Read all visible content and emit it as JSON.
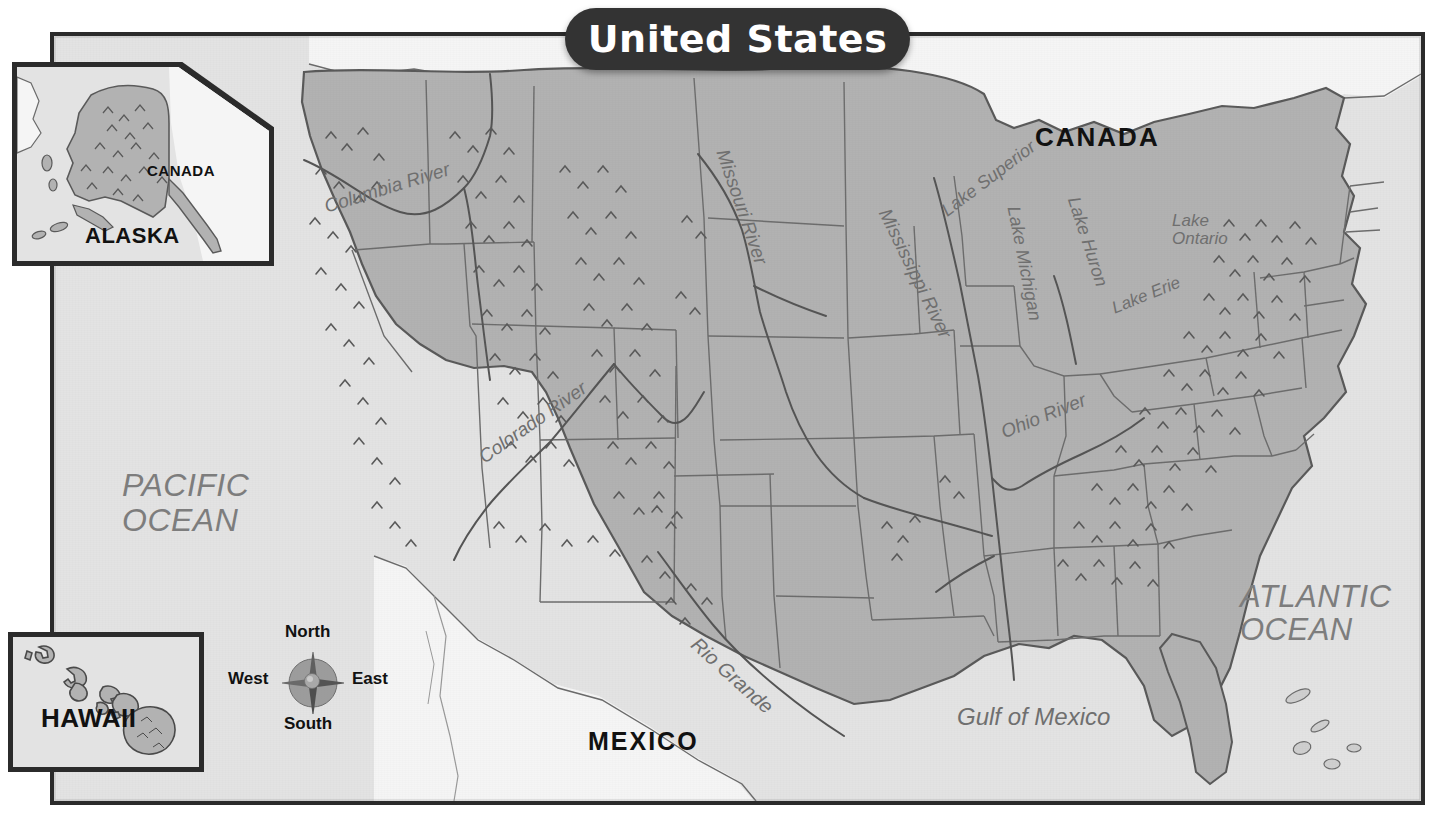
{
  "title": "United States",
  "colors": {
    "title_pill": "#333333",
    "title_text": "#ffffff",
    "us_land": "#b2b2b2",
    "neighbor_land": "#f5f5f5",
    "ocean": "#e3e3e3",
    "frame": "#2b2b2b",
    "label_water": "#6f6f6f",
    "label_country": "#111111"
  },
  "countries": [
    {
      "name": "CANADA",
      "x": 1035,
      "y": 122,
      "size": 26
    },
    {
      "name": "MEXICO",
      "x": 588,
      "y": 727,
      "size": 25
    }
  ],
  "oceans": [
    {
      "lines": [
        "PACIFIC",
        "OCEAN"
      ],
      "x": 122,
      "y": 468,
      "size": 32
    },
    {
      "lines": [
        "ATLANTIC",
        "OCEAN"
      ],
      "x": 1240,
      "y": 580,
      "size": 31
    }
  ],
  "water_labels": [
    {
      "name": "Gulf of Mexico",
      "x": 957,
      "y": 703,
      "size": 24,
      "rotate": 0
    },
    {
      "name": "Columbia River",
      "x": 325,
      "y": 196,
      "size": 19,
      "rotate": -17
    },
    {
      "name": "Colorado River",
      "x": 481,
      "y": 448,
      "size": 19,
      "rotate": -35
    },
    {
      "name": "Missouri River",
      "x": 722,
      "y": 139,
      "size": 19,
      "rotate": 71
    },
    {
      "name": "Mississippi River",
      "x": 884,
      "y": 199,
      "size": 19,
      "rotate": 64
    },
    {
      "name": "Ohio River",
      "x": 1002,
      "y": 422,
      "size": 19,
      "rotate": -22
    },
    {
      "name": "Rio Grande",
      "x": 694,
      "y": 630,
      "size": 20,
      "rotate": 42
    },
    {
      "name": "Lake Superior",
      "x": 944,
      "y": 202,
      "size": 18,
      "rotate": -37
    },
    {
      "name": "Lake Michigan",
      "x": 1013,
      "y": 196,
      "size": 18,
      "rotate": 79
    },
    {
      "name": "Lake Huron",
      "x": 1073,
      "y": 187,
      "size": 18,
      "rotate": 72
    },
    {
      "name": "Lake Erie",
      "x": 1113,
      "y": 299,
      "size": 17,
      "rotate": -22
    },
    {
      "name": "Lake Ontario",
      "x": 1172,
      "y": 215,
      "size": 17,
      "rotate": 0
    }
  ],
  "insets": {
    "alaska": {
      "label": "ALASKA",
      "neighbor_label": "CANADA"
    },
    "hawaii": {
      "label": "HAWAII"
    }
  },
  "compass": {
    "north": "North",
    "south": "South",
    "east": "East",
    "west": "West"
  }
}
